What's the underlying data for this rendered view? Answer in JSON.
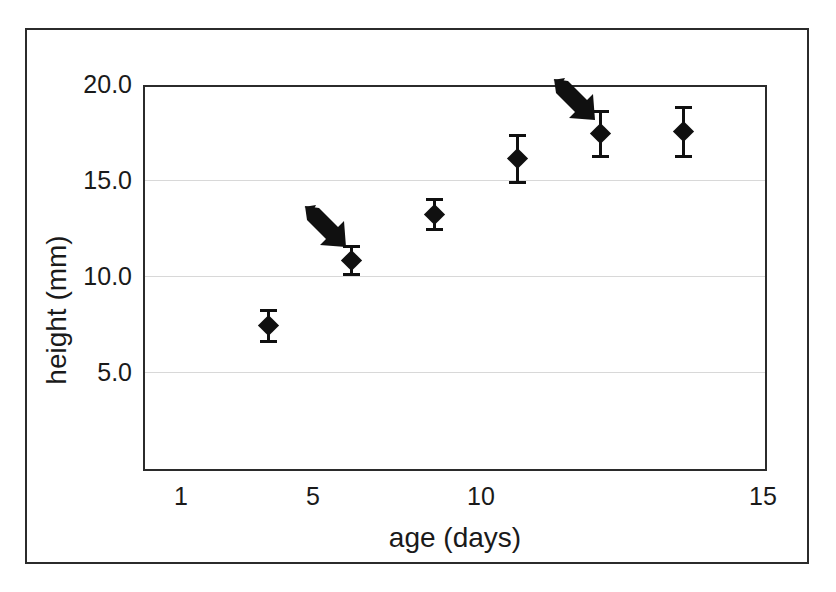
{
  "figure": {
    "border_color": "#2b2b2b",
    "background": "#ffffff"
  },
  "chart_data": {
    "type": "scatter",
    "title": "",
    "subtitle": "",
    "xlabel": "age (days)",
    "ylabel": "height (mm)",
    "xlim": [
      1,
      15
    ],
    "ylim": [
      0,
      20
    ],
    "xticks": [
      "1",
      "5",
      "10",
      "15"
    ],
    "xtick_values": [
      1,
      5,
      10,
      15
    ],
    "yticks": [
      "5.0",
      "10.0",
      "15.0",
      "20.0"
    ],
    "ytick_values": [
      5.0,
      10.0,
      15.0,
      20.0
    ],
    "grid": "horizontal",
    "gridline_color": "#d8d8d8",
    "legend": "none",
    "marker_shape": "filled-diamond",
    "marker_color": "#101010",
    "error_bars": "vertical",
    "x": [
      3,
      5,
      7,
      9,
      11,
      13
    ],
    "values": [
      7.4,
      10.8,
      13.2,
      16.1,
      17.4,
      17.5
    ],
    "yerr": [
      0.85,
      0.75,
      0.8,
      1.25,
      1.2,
      1.3
    ],
    "points": [
      {
        "x": 3,
        "y": 7.4,
        "err": 0.85,
        "label": ""
      },
      {
        "x": 5,
        "y": 10.8,
        "err": 0.75,
        "label": ""
      },
      {
        "x": 7,
        "y": 13.2,
        "err": 0.8,
        "label": ""
      },
      {
        "x": 9,
        "y": 16.1,
        "err": 1.25,
        "label": ""
      },
      {
        "x": 11,
        "y": 17.4,
        "err": 1.2,
        "label": ""
      },
      {
        "x": 13,
        "y": 17.5,
        "err": 1.3,
        "label": ""
      }
    ],
    "annotations": [
      {
        "kind": "arrow",
        "direction": "down-right",
        "points_to_x": 5,
        "points_to_y": 10.8
      },
      {
        "kind": "arrow",
        "direction": "down-right",
        "points_to_x": 11,
        "points_to_y": 17.4
      }
    ]
  }
}
